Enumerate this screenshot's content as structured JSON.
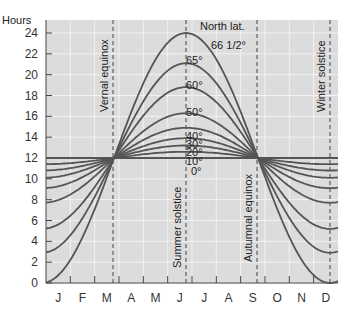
{
  "chart_data": {
    "type": "line",
    "title": "",
    "ylabel": "Hours",
    "xlabel": "",
    "ylim": [
      0,
      24
    ],
    "yticks": [
      0,
      2,
      4,
      6,
      8,
      10,
      12,
      14,
      16,
      18,
      20,
      22,
      24
    ],
    "categories": [
      "J",
      "F",
      "M",
      "A",
      "M",
      "J",
      "J",
      "A",
      "S",
      "O",
      "N",
      "D"
    ],
    "legend_title": "North lat.",
    "annotations": [
      "Vernal equinox",
      "Summer solstice",
      "Autumnal equinox",
      "Winter solstice"
    ],
    "series": [
      {
        "name": "0°",
        "summer": 12,
        "winter": 12
      },
      {
        "name": "10°",
        "summer": 12.6,
        "winter": 11.4
      },
      {
        "name": "20°",
        "summer": 13.2,
        "winter": 10.8
      },
      {
        "name": "30°",
        "summer": 13.9,
        "winter": 10.1
      },
      {
        "name": "40°",
        "summer": 14.9,
        "winter": 9.1
      },
      {
        "name": "50°",
        "summer": 16.3,
        "winter": 7.7
      },
      {
        "name": "60°",
        "summer": 18.8,
        "winter": 5.2
      },
      {
        "name": "65°",
        "summer": 21.1,
        "winter": 2.9
      },
      {
        "name": "66 1/2°",
        "summer": 24,
        "winter": 0
      }
    ],
    "grid": true
  },
  "labels": {
    "hours": "Hours",
    "north_lat": "North lat.",
    "vernal": "Vernal equinox",
    "summer": "Summer solstice",
    "autumnal": "Autumnal equinox",
    "winter": "Winter solstice"
  }
}
